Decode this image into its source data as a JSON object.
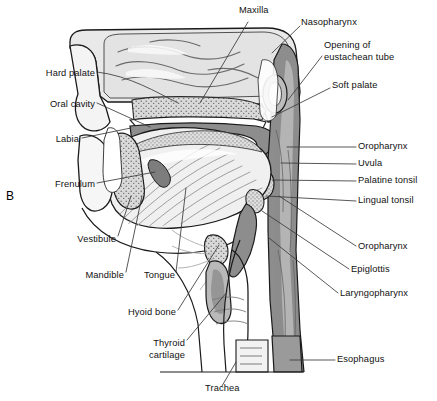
{
  "figure": {
    "panel_letter": "B",
    "background": "#ffffff"
  },
  "palette": {
    "outline": "#1a1a1a",
    "mucosa_gray": "#8d8d8d",
    "mucosa_dark": "#6f6f6f",
    "bone_light": "#d9d9d9",
    "bone_stipple": "#c9c9c9",
    "cavity_white": "#ffffff",
    "muscle_light": "#e8e8e8",
    "leader_line": "#3a3a3a"
  },
  "labels_left": [
    {
      "id": "hard-palate",
      "text": "Hard palate",
      "x": 22,
      "y": 75,
      "tip_x": 178,
      "tip_y": 103
    },
    {
      "id": "oral-cavity",
      "text": "Oral cavity",
      "x": 24,
      "y": 106,
      "tip_x": 150,
      "tip_y": 127
    },
    {
      "id": "labia",
      "text": "Labia",
      "x": 44,
      "y": 141,
      "tip_x": 131,
      "tip_y": 128
    },
    {
      "id": "frenulum",
      "text": "Frenulum",
      "x": 34,
      "y": 186,
      "tip_x": 155,
      "tip_y": 172
    },
    {
      "id": "vestibule",
      "text": "Vestibule",
      "x": 78,
      "y": 241,
      "tip_x": 131,
      "tip_y": 196
    },
    {
      "id": "mandible",
      "text": "Mandible",
      "x": 84,
      "y": 277,
      "tip_x": 142,
      "tip_y": 196
    },
    {
      "id": "tongue",
      "text": "Tongue",
      "x": 146,
      "y": 277,
      "tip_x": 186,
      "tip_y": 188
    },
    {
      "id": "hyoid-bone",
      "text": "Hyoid bone",
      "x": 115,
      "y": 314,
      "tip_x": 219,
      "tip_y": 243
    },
    {
      "id": "thyroid-cartilage",
      "text": "Thyroid",
      "x": 143,
      "y": 345,
      "text2": "cartilage",
      "tip_x": 227,
      "tip_y": 290
    },
    {
      "id": "trachea",
      "text": "Trachea",
      "x": 207,
      "y": 390,
      "tip_x": 236,
      "tip_y": 362
    }
  ],
  "labels_right": [
    {
      "id": "maxilla",
      "text": "Maxilla",
      "x": 241,
      "y": 12,
      "tip_x": 200,
      "tip_y": 103
    },
    {
      "id": "nasopharynx",
      "text": "Nasopharynx",
      "x": 303,
      "y": 23,
      "tip_x": 272,
      "tip_y": 53
    },
    {
      "id": "eustachean-opening",
      "text": "Opening of",
      "text2": "eustachean tube",
      "x": 326,
      "y": 46,
      "tip_x": 288,
      "tip_y": 100
    },
    {
      "id": "soft-palate",
      "text": "Soft palate",
      "x": 333,
      "y": 86,
      "tip_x": 272,
      "tip_y": 117
    },
    {
      "id": "oropharynx-upper",
      "text": "Oropharynx",
      "x": 359,
      "y": 147,
      "tip_x": 287,
      "tip_y": 147
    },
    {
      "id": "uvula",
      "text": "Uvula",
      "x": 359,
      "y": 164,
      "tip_x": 281,
      "tip_y": 163
    },
    {
      "id": "palatine-tonsil",
      "text": "Palatine tonsil",
      "x": 359,
      "y": 181,
      "tip_x": 272,
      "tip_y": 180
    },
    {
      "id": "lingual-tonsil",
      "text": "Lingual tonsil",
      "x": 359,
      "y": 201,
      "tip_x": 266,
      "tip_y": 196
    },
    {
      "id": "oropharynx-lower",
      "text": "Oropharynx",
      "x": 359,
      "y": 248,
      "tip_x": 279,
      "tip_y": 196
    },
    {
      "id": "epiglottis",
      "text": "Epiglottis",
      "x": 352,
      "y": 271,
      "tip_x": 262,
      "tip_y": 211
    },
    {
      "id": "laryngopharynx",
      "text": "Laryngopharynx",
      "x": 341,
      "y": 295,
      "tip_x": 269,
      "tip_y": 238
    },
    {
      "id": "esophagus",
      "text": "Esophagus",
      "x": 338,
      "y": 360,
      "tip_x": 290,
      "tip_y": 360
    }
  ]
}
